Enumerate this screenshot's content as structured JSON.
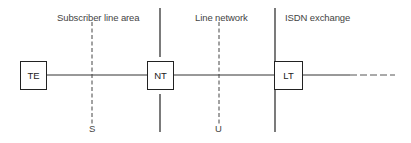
{
  "diagram": {
    "areas": [
      {
        "label": "Subscriber line area"
      },
      {
        "label": "Line network"
      },
      {
        "label": "ISDN exchange"
      }
    ],
    "blocks": [
      {
        "label": "TE"
      },
      {
        "label": "NT"
      },
      {
        "label": "LT"
      }
    ],
    "reference_points": [
      {
        "label": "S"
      },
      {
        "label": "U"
      }
    ],
    "colors": {
      "line": "#222222",
      "text": "#444444",
      "background": "#ffffff"
    }
  }
}
